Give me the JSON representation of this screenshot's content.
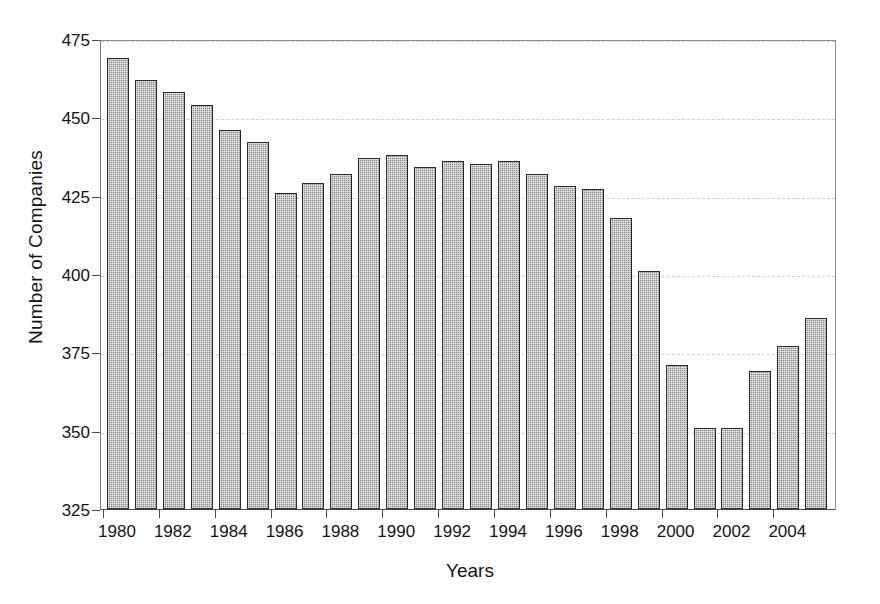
{
  "chart_data": {
    "type": "bar",
    "title": "",
    "xlabel": "Years",
    "ylabel": "Number of Companies",
    "categories": [
      "1980",
      "1981",
      "1982",
      "1983",
      "1984",
      "1985",
      "1986",
      "1987",
      "1988",
      "1989",
      "1990",
      "1991",
      "1992",
      "1993",
      "1994",
      "1995",
      "1996",
      "1997",
      "1998",
      "1999",
      "2000",
      "2001",
      "2002",
      "2003",
      "2004",
      "2005"
    ],
    "values": [
      469,
      462,
      458,
      454,
      446,
      442,
      426,
      429,
      432,
      437,
      438,
      434,
      436,
      435,
      436,
      432,
      428,
      427,
      418,
      401,
      371,
      351,
      351,
      369,
      377,
      386
    ],
    "ylim": [
      325,
      475
    ],
    "y_ticks": [
      325,
      350,
      375,
      400,
      425,
      450,
      475
    ],
    "x_tick_labels": [
      "1980",
      "1982",
      "1984",
      "1986",
      "1988",
      "1990",
      "1992",
      "1994",
      "1996",
      "1998",
      "2000",
      "2002",
      "2004"
    ],
    "grid": true,
    "legend": null,
    "bar_color": "#8b8b8b",
    "bar_edge_color": "#2b2b2b",
    "axis_color": "#4a4a4a",
    "gridline_color": "#cfcfcf",
    "background": "#ffffff"
  }
}
